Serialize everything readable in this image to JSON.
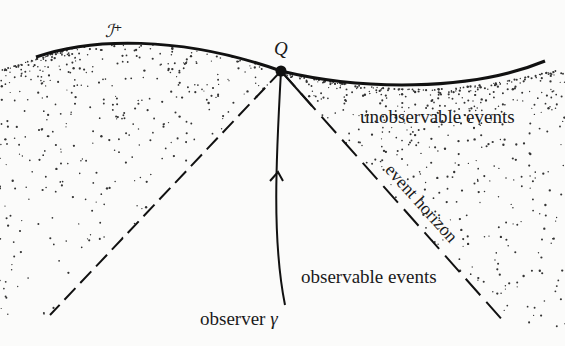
{
  "diagram": {
    "title_symbol": "ℐ⁺",
    "point_label": "Q",
    "labels": {
      "unobservable": "unobservable events",
      "horizon": "event horizon",
      "observable": "observable events",
      "observer": "observer",
      "observer_symbol": "γ"
    },
    "colors": {
      "ink": "#111111",
      "background": "#fbfbfa",
      "stipple": "#333333"
    }
  }
}
